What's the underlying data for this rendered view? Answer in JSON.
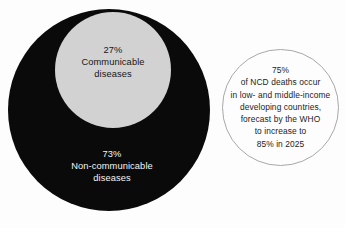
{
  "chart_data": {
    "type": "pie",
    "title": "",
    "categories": [
      "Communicable diseases",
      "Non-communicable diseases"
    ],
    "values": [
      27,
      73
    ],
    "value_unit": "%",
    "xlabel": "",
    "ylabel": "",
    "legend": "none",
    "grid": false,
    "colors": {
      "communicable": "#d2d2d2",
      "non_communicable": "#0a0a0a",
      "background": "#fdfdfd",
      "callout_outline": "#a8a8a8",
      "dark_text": "#171717",
      "light_text": "#f4f4f4"
    },
    "annotations": [
      "75%",
      "of NCD deaths occur",
      "in low- and middle-income",
      "developing countries,",
      "forecast by the WHO",
      "to increase to",
      "85% in 2025"
    ]
  },
  "diagram": {
    "communicable": {
      "percent": "27%",
      "name_line1": "Communicable",
      "name_line2": "diseases"
    },
    "non_communicable": {
      "percent": "73%",
      "name_line1": "Non-communicable",
      "name_line2": "diseases"
    },
    "callout": {
      "line1": "75%",
      "line2": "of NCD deaths occur",
      "line3": "in low- and middle-income",
      "line4": "developing countries,",
      "line5": "forecast by the WHO",
      "line6": "to increase to",
      "line7": "85% in 2025"
    }
  }
}
